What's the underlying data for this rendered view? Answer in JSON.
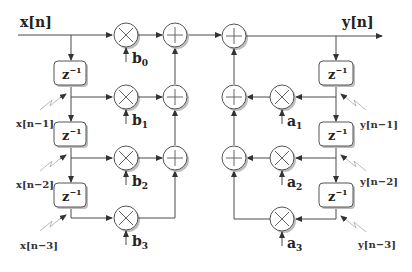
{
  "diagram": {
    "type": "IIR filter direct form I block diagram",
    "input_label": "x[n]",
    "output_label": "y[n]",
    "delay_label": "z",
    "delay_exp": "−1",
    "feedforward": {
      "taps": [
        {
          "signal": "x[n]",
          "coef": "b",
          "sub": "0"
        },
        {
          "signal": "x[n−1]",
          "coef": "b",
          "sub": "1"
        },
        {
          "signal": "x[n−2]",
          "coef": "b",
          "sub": "2"
        },
        {
          "signal": "x[n−3]",
          "coef": "b",
          "sub": "3"
        }
      ]
    },
    "feedback": {
      "taps": [
        {
          "signal": "y[n−1]",
          "coef": "a",
          "sub": "1"
        },
        {
          "signal": "y[n−2]",
          "coef": "a",
          "sub": "2"
        },
        {
          "signal": "y[n−3]",
          "coef": "a",
          "sub": "3"
        }
      ]
    },
    "colors": {
      "line": "#4a4a4a",
      "node_fill": "#ffffff",
      "shadow": "#bdbdbd",
      "text": "#222222"
    }
  }
}
